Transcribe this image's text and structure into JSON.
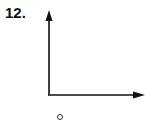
{
  "problem": {
    "number": "12."
  },
  "diagram": {
    "type": "coordinate-axes",
    "y_axis": {
      "direction": "up",
      "label": ""
    },
    "x_axis": {
      "direction": "right",
      "label": ""
    },
    "below_mark": "o",
    "colors": {
      "stroke": "#111111",
      "background": "#ffffff"
    }
  }
}
